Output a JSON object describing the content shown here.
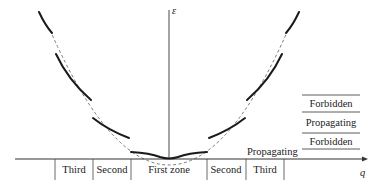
{
  "figure": {
    "axes": {
      "y_label": "ε",
      "x_label": "q"
    },
    "zones": [
      {
        "label": "Third",
        "x_center": 74
      },
      {
        "label": "Second",
        "x_center": 112
      },
      {
        "label": "First zone",
        "x_center": 169
      },
      {
        "label": "Second",
        "x_center": 226
      },
      {
        "label": "Third",
        "x_center": 265
      }
    ],
    "band_legend": [
      {
        "label": "Forbidden"
      },
      {
        "label": "Propagating"
      },
      {
        "label": "Forbidden"
      }
    ],
    "propagating_bottom_label": "Propagating",
    "colors": {
      "curve": "#1a1a1a",
      "dashed": "#555555",
      "axis": "#333333"
    }
  }
}
